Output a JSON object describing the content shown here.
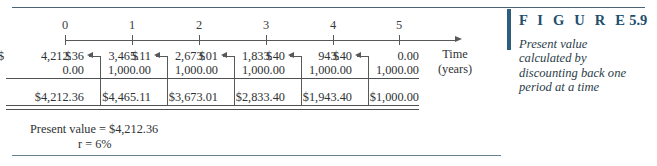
{
  "figure": {
    "label_spaced": "F I G U R E",
    "number": "5.9",
    "caption_lines": [
      "Present value",
      "calculated by",
      "discounting back one",
      "period at a time"
    ],
    "accent_color": "#214f6e",
    "rule_color": "#4a6272"
  },
  "timeline": {
    "tick_labels": [
      "0",
      "1",
      "2",
      "3",
      "4",
      "5"
    ],
    "axis_label_line1": "Time",
    "axis_label_line2": "(years)"
  },
  "columns": [
    {
      "period": "0",
      "dollar": "$",
      "value": "4,212.36",
      "cash_flow": "0.00",
      "total_dollar": "$",
      "total": "4,212.36"
    },
    {
      "period": "1",
      "dollar": "$",
      "value": "3,465.11",
      "cash_flow": "1,000.00",
      "total_dollar": "$",
      "total": "4,465.11"
    },
    {
      "period": "2",
      "dollar": "$",
      "value": "2,673.01",
      "cash_flow": "1,000.00",
      "total_dollar": "$",
      "total": "3,673.01"
    },
    {
      "period": "3",
      "dollar": "$",
      "value": "1,833.40",
      "cash_flow": "1,000.00",
      "total_dollar": "$",
      "total": "2,833.40"
    },
    {
      "period": "4",
      "dollar": "$",
      "value": "943.40",
      "cash_flow": "1,000.00",
      "total_dollar": "$",
      "total": "1,943.40"
    },
    {
      "period": "5",
      "dollar": "$",
      "value": "0.00",
      "cash_flow": "1,000.00",
      "total_dollar": "$",
      "total": "1,000.00"
    }
  ],
  "footer": {
    "present_value": "Present value = $4,212.36",
    "rate": "r = 6%"
  }
}
